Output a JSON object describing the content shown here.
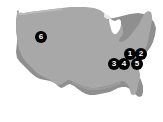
{
  "figure": {
    "background_color": "#ffffff",
    "land_fill_color": "#a8a8a8",
    "land_shadow_color": "#8d8d8d",
    "land_highlight_color": "#bdbdbd",
    "marker_fill_color": "#000000",
    "marker_text_color": "#ffffff",
    "width_px": 163,
    "height_px": 122
  },
  "map": {
    "region_name": "Contiguous United States",
    "projection_hint": "silhouette"
  },
  "markers": [
    {
      "label": "6",
      "name": "marker-6",
      "x": 41,
      "y": 37,
      "region": "west"
    },
    {
      "label": "1",
      "name": "marker-1",
      "x": 130,
      "y": 54,
      "region": "northeast"
    },
    {
      "label": "2",
      "name": "marker-2",
      "x": 141,
      "y": 54,
      "region": "northeast"
    },
    {
      "label": "3",
      "name": "marker-3",
      "x": 114,
      "y": 64,
      "region": "southeast-interior"
    },
    {
      "label": "4",
      "name": "marker-4",
      "x": 124,
      "y": 64,
      "region": "southeast-interior"
    },
    {
      "label": "5",
      "name": "marker-5",
      "x": 137,
      "y": 64,
      "region": "southeast-coast"
    }
  ]
}
